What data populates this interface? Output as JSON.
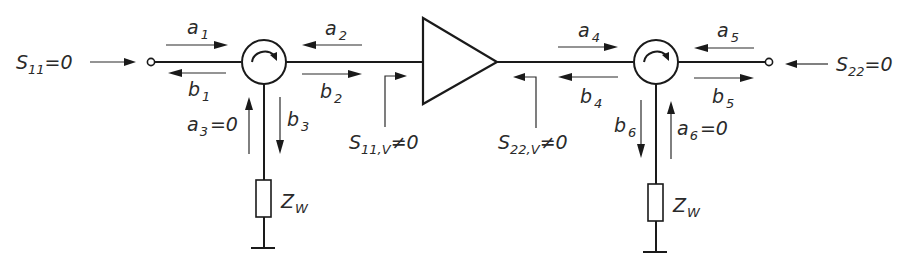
{
  "diagram": {
    "colors": {
      "line": "#1a1a1a",
      "text": "#2a2a2a",
      "background": "#ffffff"
    },
    "left_port": {
      "label_main": "S",
      "label_sub": "11",
      "label_value": "=0"
    },
    "right_port": {
      "label_main": "S",
      "label_sub": "22",
      "label_value": "=0"
    },
    "waves": {
      "a1": {
        "main": "a",
        "sub": "1"
      },
      "b1": {
        "main": "b",
        "sub": "1"
      },
      "a2": {
        "main": "a",
        "sub": "2"
      },
      "b2": {
        "main": "b",
        "sub": "2"
      },
      "a3": {
        "main": "a",
        "sub": "3",
        "value": "=0"
      },
      "b3": {
        "main": "b",
        "sub": "3"
      },
      "a4": {
        "main": "a",
        "sub": "4"
      },
      "b4": {
        "main": "b",
        "sub": "4"
      },
      "a5": {
        "main": "a",
        "sub": "5"
      },
      "b5": {
        "main": "b",
        "sub": "5"
      },
      "a6": {
        "main": "a",
        "sub": "6",
        "value": "=0"
      },
      "b6": {
        "main": "b",
        "sub": "6"
      }
    },
    "amp_input": {
      "main": "S",
      "sub": "11,V",
      "value": "≠0"
    },
    "amp_output": {
      "main": "S",
      "sub": "22,V",
      "value": "≠0"
    },
    "load_left": {
      "main": "Z",
      "sub": "W"
    },
    "load_right": {
      "main": "Z",
      "sub": "W"
    }
  }
}
